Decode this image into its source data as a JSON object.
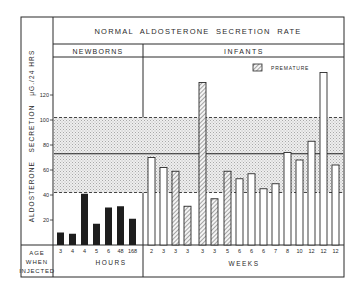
{
  "chart_data": {
    "type": "bar",
    "title": "NORMAL ALDOSTERONE SECRETION RATE",
    "ylabel": "ALDOSTERONE SECRETION μG./24 HRS",
    "ylim": [
      0,
      140
    ],
    "yticks": [
      20,
      40,
      60,
      80,
      100,
      120
    ],
    "grid": false,
    "groups": [
      {
        "name": "NEWBORNS",
        "unit_label": "HOURS",
        "categories": [
          "3",
          "4",
          "4",
          "5",
          "6",
          "48",
          "168"
        ],
        "values": [
          10,
          9,
          41,
          17,
          30,
          31,
          21
        ],
        "premature": [
          false,
          false,
          false,
          false,
          false,
          false,
          false
        ],
        "fill": "solid-black"
      },
      {
        "name": "INFANTS",
        "unit_label": "WEEKS",
        "categories": [
          "2",
          "3",
          "3",
          "3",
          "3",
          "3",
          "5",
          "6",
          "6",
          "6",
          "7",
          "8",
          "10",
          "12",
          "12",
          "12"
        ],
        "values": [
          70,
          62,
          59,
          31,
          130,
          37,
          59,
          53,
          57,
          45,
          49,
          74,
          68,
          83,
          138,
          64
        ],
        "premature": [
          false,
          false,
          true,
          true,
          true,
          true,
          true,
          false,
          false,
          false,
          false,
          false,
          false,
          false,
          false,
          false
        ],
        "fill": "white-outline"
      }
    ],
    "reference_band": {
      "label": "normal range",
      "upper_dashed": 102,
      "mean_solid": 73,
      "lower_dashed": 42,
      "fill": "stippled-gray"
    },
    "legend": [
      {
        "label": "PREMATURE",
        "pattern": "diagonal-hatch"
      }
    ],
    "x_row_label": [
      "AGE",
      "WHEN",
      "INJECTED"
    ]
  },
  "header": {
    "title": "NORMAL  ALDOSTERONE  SECRETION  RATE",
    "section_newborns": "NEWBORNS",
    "section_infants": "INFANTS"
  },
  "axis": {
    "ylabel": "ALDOSTERONE   SECRETION   μG./24 HRS",
    "ticks": [
      "20",
      "40",
      "60",
      "80",
      "100",
      "120"
    ]
  },
  "footer": {
    "age_line1": "AGE",
    "age_line2": "WHEN",
    "age_line3": "INJECTED",
    "hours": "HOURS",
    "weeks": "WEEKS"
  },
  "legend": {
    "premature": "PREMATURE"
  },
  "colors": {
    "ink": "#2a2a2a",
    "band": "#d8d8d8",
    "bar_dark": "#1e1e1e",
    "paper": "#ffffff"
  }
}
